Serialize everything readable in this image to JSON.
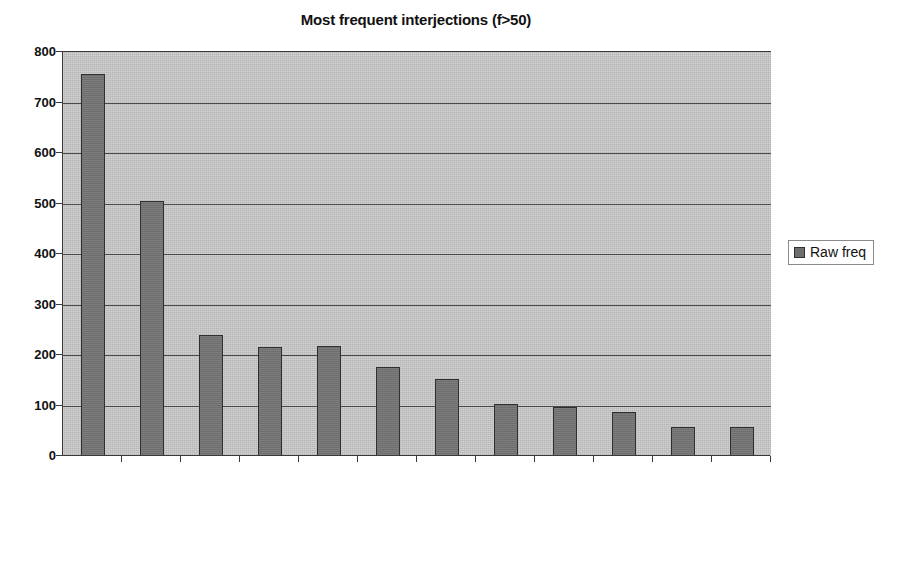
{
  "chart_data": {
    "type": "bar",
    "title": "Most frequent interjections (f>50)",
    "xlabel": "",
    "ylabel": "",
    "ylim": [
      0,
      800
    ],
    "ytick_step": 100,
    "yticks": [
      "0",
      "100",
      "200",
      "300",
      "400",
      "500",
      "600",
      "700",
      "800"
    ],
    "grid": true,
    "legend_position": "right",
    "categories": [
      "wow",
      "oh my god",
      "whoa",
      "ugh",
      "god",
      "aw",
      "geez/jeez",
      "oh god",
      "(oh) thank god",
      "ah/aw/oh man",
      "for X's sake",
      "my god"
    ],
    "series": [
      {
        "name": "Raw freq",
        "color": "#6e6e6e",
        "values": [
          756,
          505,
          240,
          215,
          217,
          177,
          152,
          103,
          98,
          88,
          57,
          57
        ]
      }
    ]
  },
  "legend": {
    "entries": [
      {
        "label": "Raw freq",
        "color": "#6e6e6e"
      }
    ]
  },
  "style": {
    "plot_background": "#b6b6b6",
    "axis_color": "#3a3a3a",
    "gridline_color": "#4a4a4a",
    "text_color": "#111111",
    "page_background": "#ffffff"
  }
}
